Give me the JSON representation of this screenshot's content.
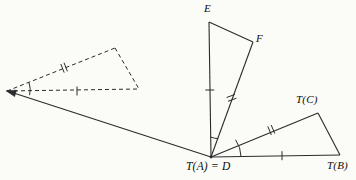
{
  "figure": {
    "background_color": "#fbfbf8",
    "stroke_color": "#2b2b2b"
  },
  "labels": {
    "E": "E",
    "F": "F",
    "TC": "T(C)",
    "TB": "T(B)",
    "TA_equals_D": "T(A) = D"
  },
  "points": {
    "E": {
      "x": 209,
      "y": 22
    },
    "F": {
      "x": 253,
      "y": 42
    },
    "D": {
      "x": 211,
      "y": 157
    },
    "TC": {
      "x": 318,
      "y": 113
    },
    "TB": {
      "x": 340,
      "y": 155
    },
    "dashed_left": {
      "x": 7,
      "y": 91
    },
    "dashed_top": {
      "x": 115,
      "y": 48
    },
    "dashed_right": {
      "x": 139,
      "y": 89
    }
  },
  "segments": [
    {
      "name": "segment-E-D",
      "from": "E",
      "to": "D",
      "style": "solid",
      "ticks": 1
    },
    {
      "name": "segment-E-F",
      "from": "E",
      "to": "F",
      "style": "solid",
      "ticks": 0
    },
    {
      "name": "segment-F-D",
      "from": "F",
      "to": "D",
      "style": "solid",
      "ticks": 2
    },
    {
      "name": "segment-D-TC",
      "from": "D",
      "to": "TC",
      "style": "solid",
      "ticks": 2
    },
    {
      "name": "segment-TC-TB",
      "from": "TC",
      "to": "TB",
      "style": "solid",
      "ticks": 0
    },
    {
      "name": "segment-D-TB",
      "from": "D",
      "to": "TB",
      "style": "solid",
      "ticks": 1
    },
    {
      "name": "segment-dashed-left-top",
      "from": "dashed_left",
      "to": "dashed_top",
      "style": "dashed",
      "ticks": 2
    },
    {
      "name": "segment-dashed-top-right",
      "from": "dashed_top",
      "to": "dashed_right",
      "style": "dashed",
      "ticks": 0
    },
    {
      "name": "segment-dashed-left-right",
      "from": "dashed_left",
      "to": "dashed_right",
      "style": "dashed",
      "ticks": 1
    }
  ],
  "arrow": {
    "name": "mapping-arrow",
    "from": {
      "x": 211,
      "y": 157
    },
    "to": {
      "x": 6,
      "y": 91
    },
    "description": "arrow from vertex T(A)=D to the dashed triangle's marked vertex"
  },
  "angle_arcs": [
    {
      "name": "angle-arc-at-D-left",
      "vertex": "D",
      "radius": 20
    },
    {
      "name": "angle-arc-at-D-right",
      "vertex": "D",
      "radius": 30
    },
    {
      "name": "angle-arc-dashed-left-vertex",
      "vertex": "dashed_left",
      "radius": 22
    }
  ]
}
